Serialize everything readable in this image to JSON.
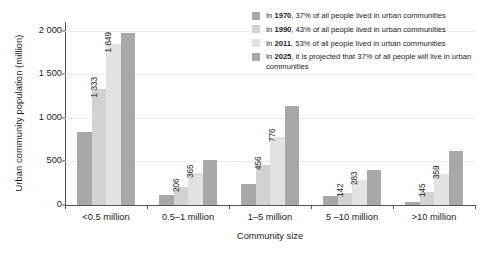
{
  "chart_data": {
    "type": "bar",
    "title": "",
    "xlabel": "Community size",
    "ylabel": "Urban community population (million)",
    "categories": [
      "<0.5 million",
      "0.5–1 million",
      "1–5 million",
      "5 –10 million",
      ">10 million"
    ],
    "ylim": [
      0,
      2100
    ],
    "yticks": [
      0,
      500,
      1000,
      1500,
      2000
    ],
    "ytick_labels": [
      "0",
      "500",
      "1 000",
      "1 500",
      "2 000"
    ],
    "grid": "horizontal",
    "legend_position": "top-right",
    "series": [
      {
        "name": "1970",
        "color": "#a8a8a8",
        "values": [
          835,
          120,
          240,
          98,
          30
        ],
        "labels": [
          "",
          "",
          "",
          "",
          ""
        ]
      },
      {
        "name": "1990",
        "color": "#d2d2d2",
        "values": [
          1333,
          206,
          456,
          142,
          145
        ],
        "labels": [
          "1 333",
          "206",
          "456",
          "142",
          "145"
        ]
      },
      {
        "name": "2011",
        "color": "#e2e2e2",
        "values": [
          1849,
          365,
          776,
          283,
          359
        ],
        "labels": [
          "1 849",
          "365",
          "776",
          "283",
          "359"
        ]
      },
      {
        "name": "2025",
        "color": "#a8a8a8",
        "values": [
          1977,
          515,
          1135,
          400,
          625
        ],
        "labels": [
          "",
          "",
          "",
          "",
          ""
        ]
      }
    ]
  },
  "legend": {
    "items": [
      {
        "year": "1970",
        "prefix": "In ",
        "text": ", 37% of all people lived in urban communities",
        "color": "#a8a8a8"
      },
      {
        "year": "1990",
        "prefix": "In ",
        "text": ", 43% of all people lived in urban communities",
        "color": "#d2d2d2"
      },
      {
        "year": "2011",
        "prefix": "In ",
        "text": ", 53% of all people lived in urban communities",
        "color": "#e2e2e2"
      },
      {
        "year": "2025",
        "prefix": "In ",
        "text": ", it is projected that 37% of all people will live in urban communities",
        "color": "#a8a8a8"
      }
    ]
  }
}
